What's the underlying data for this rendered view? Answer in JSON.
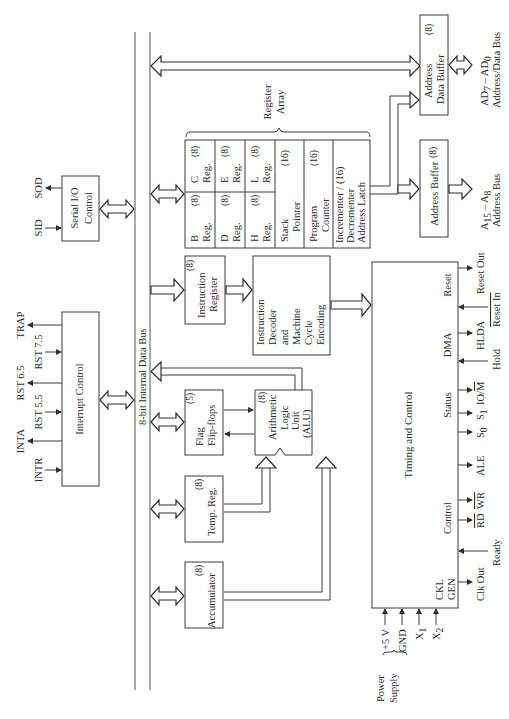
{
  "internal_bus": {
    "label": "8-bit Internal Data Bus"
  },
  "serial_io": {
    "label1": "Serial I/O",
    "label2": "Control",
    "sid": "SID",
    "sod": "SOD"
  },
  "interrupt": {
    "label": "Interrupt Control",
    "pins": [
      "INTR",
      "INTA",
      "RST 5.5",
      "RST 6.5",
      "RST 7.5",
      "TRAP"
    ]
  },
  "register_array": {
    "brace_label1": "Register",
    "brace_label2": "Array",
    "rows": [
      {
        "left": "B",
        "left2": "Reg.",
        "left_bits": "(8)",
        "right": "C",
        "right2": "Reg.",
        "right_bits": "(8)"
      },
      {
        "left": "D",
        "left2": "Reg.",
        "left_bits": "(8)",
        "right": "E",
        "right2": "Reg.",
        "right_bits": "(8)"
      },
      {
        "left": "H",
        "left2": "Reg.",
        "left_bits": "(8)",
        "right": "L",
        "right2": "Reg.",
        "right_bits": "(8)"
      }
    ],
    "stack_pointer": {
      "l1": "Stack",
      "l2": "Pointer",
      "bits": "(16)"
    },
    "program_counter": {
      "l1": "Program",
      "l2": "Counter",
      "bits": "(16)"
    },
    "inc_dec": {
      "l1": "Incrementer / (16)",
      "l2": "Decrementer",
      "l3": "Address Latch"
    }
  },
  "instruction_register": {
    "l1": "Instruction",
    "l2": "Register",
    "bits": "(8)"
  },
  "instruction_decoder": {
    "lines": [
      "Instruction",
      "Decoder",
      "and",
      "Machine",
      "Cycle",
      "Encoding"
    ]
  },
  "flag": {
    "l1": "Flag",
    "l2": "Flip-flops",
    "bits": "(5)"
  },
  "alu": {
    "lines": [
      "Arithmetic",
      "Logic",
      "Unit",
      "(ALU)"
    ],
    "bits": "(8)"
  },
  "temp_reg": {
    "label": "Temp. Reg.",
    "bits": "(8)"
  },
  "accumulator": {
    "label": "Accumulator",
    "bits": "(8)"
  },
  "timing_control": {
    "label": "Timing and Control",
    "groups": {
      "clk": "CKL",
      "gen": "GEN",
      "control": "Control",
      "status": "Status",
      "dma": "DMA",
      "reset": "Reset"
    },
    "pins": {
      "clk_out": "Clk Out",
      "ready": "Ready",
      "rd": "RD",
      "wr": "WR",
      "ale": "ALE",
      "s0": "S",
      "s0sub": "0",
      "s1": "S",
      "s1sub": "1",
      "io_m": "IO/",
      "io_m_bar": "M",
      "hold": "Hold",
      "hlda": "HLDA",
      "reset_in": "Reset In",
      "reset_out": "Reset Out"
    }
  },
  "power": {
    "label1": "Power",
    "label2": "Supply",
    "v5": "+5 V",
    "gnd": "GND",
    "x1": "X",
    "x1sub": "1",
    "x2": "X",
    "x2sub": "2"
  },
  "address_buffer": {
    "label": "Address Buffer",
    "bits": "(8)",
    "bus_a": "A",
    "bus_a15": "15",
    "bus_dash": " – A",
    "bus_a8": "8",
    "bus_label": "Address Bus"
  },
  "address_data_buffer": {
    "l1": "Address",
    "l2": "Data Buffer",
    "bits": "(8)",
    "ad": "AD",
    "ad7": "7",
    "dash": " – AD",
    "ad0": "0",
    "bus_label": "Address/Data Bus"
  }
}
